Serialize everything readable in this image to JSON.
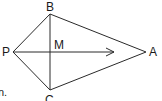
{
  "diagram": {
    "type": "kite-geometry",
    "points": {
      "B": {
        "label": "B",
        "x": 50,
        "y": 14
      },
      "P": {
        "label": "P",
        "x": 13,
        "y": 52
      },
      "A": {
        "label": "A",
        "x": 146,
        "y": 52
      },
      "C": {
        "label": "C",
        "x": 50,
        "y": 90
      },
      "M": {
        "label": "M",
        "x": 50,
        "y": 52
      }
    },
    "segments": [
      "PB",
      "BA",
      "AC",
      "CP",
      "BC"
    ],
    "vector": {
      "from": "P",
      "to_x": 114,
      "y": 52,
      "description": "arrow from P toward A"
    },
    "stroke_color": "#2a2a2a",
    "fragment_text": "n."
  }
}
